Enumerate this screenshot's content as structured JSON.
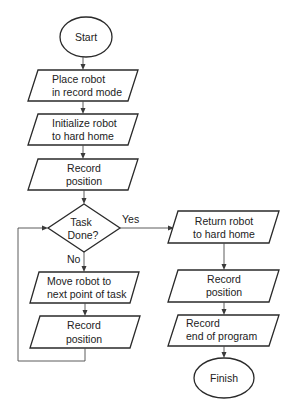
{
  "diagram": {
    "type": "flowchart",
    "nodes": {
      "start": {
        "shape": "terminator",
        "lines": [
          "Start"
        ]
      },
      "place": {
        "shape": "io",
        "lines": [
          "Place robot",
          "in record mode"
        ]
      },
      "init": {
        "shape": "io",
        "lines": [
          "Initialize robot",
          "to hard home"
        ]
      },
      "record1": {
        "shape": "io",
        "lines": [
          "Record",
          "position"
        ]
      },
      "decision": {
        "shape": "decision",
        "lines": [
          "Task",
          "Done?"
        ]
      },
      "move": {
        "shape": "io",
        "lines": [
          "Move robot to",
          "next point of task"
        ]
      },
      "record2": {
        "shape": "io",
        "lines": [
          "Record",
          "position"
        ]
      },
      "return": {
        "shape": "io",
        "lines": [
          "Return robot",
          "to hard home"
        ]
      },
      "record3": {
        "shape": "io",
        "lines": [
          "Record",
          "position"
        ]
      },
      "record_end": {
        "shape": "io",
        "lines": [
          "Record",
          "end of program"
        ]
      },
      "finish": {
        "shape": "terminator",
        "lines": [
          "Finish"
        ]
      }
    },
    "edge_labels": {
      "yes": "Yes",
      "no": "No"
    },
    "edges": [
      {
        "from": "start",
        "to": "place"
      },
      {
        "from": "place",
        "to": "init"
      },
      {
        "from": "init",
        "to": "record1"
      },
      {
        "from": "record1",
        "to": "decision"
      },
      {
        "from": "decision",
        "to": "return",
        "label": "Yes"
      },
      {
        "from": "decision",
        "to": "move",
        "label": "No"
      },
      {
        "from": "move",
        "to": "record2"
      },
      {
        "from": "record2",
        "to": "decision"
      },
      {
        "from": "return",
        "to": "record3"
      },
      {
        "from": "record3",
        "to": "record_end"
      },
      {
        "from": "record_end",
        "to": "finish"
      }
    ]
  }
}
